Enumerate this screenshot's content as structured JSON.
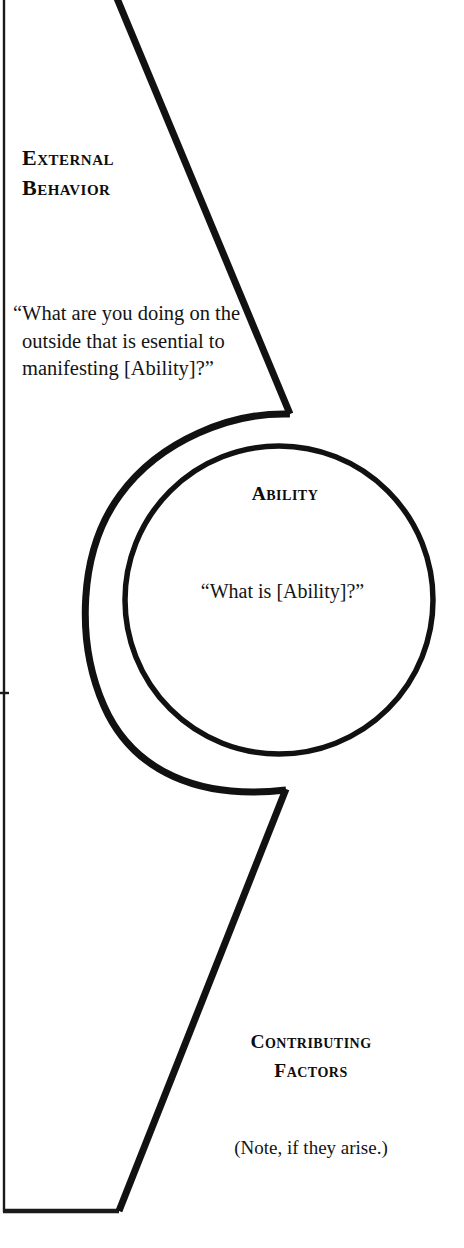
{
  "diagram": {
    "stroke_color": "#111111",
    "background_color": "#ffffff",
    "sections": {
      "external_behavior": {
        "heading_line_1": "External",
        "heading_line_2": "Behavior",
        "question": "“What are you doing on the outside that is esential to manifesting [Ability]?”"
      },
      "ability": {
        "heading": "Ability",
        "question": "“What is [Ability]?”"
      },
      "contributing_factors": {
        "heading_line_1": "Contributing",
        "heading_line_2": "Factors",
        "note": "(Note, if they arise.)"
      }
    },
    "shapes": {
      "inner_circle": "ability-circle",
      "outer_arc": "external-behavior-arc",
      "upper_diagonal": "upper-diagonal-edge",
      "lower_diagonal": "lower-diagonal-edge",
      "left_margin_rule": "page-left-rule",
      "bottom_rule": "page-bottom-rule"
    }
  }
}
